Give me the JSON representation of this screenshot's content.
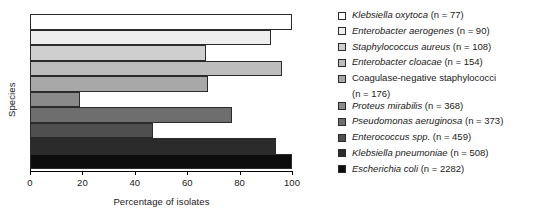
{
  "chart_data": {
    "type": "bar",
    "orientation": "horizontal",
    "title": "",
    "xlabel": "Percentage of isolates",
    "ylabel": "Species",
    "xlim": [
      0,
      100
    ],
    "grid": false,
    "legend_position": "right",
    "xticks": [
      "0",
      "20",
      "40",
      "60",
      "80",
      "100"
    ],
    "xtick_values": [
      0,
      20,
      40,
      60,
      80,
      100
    ],
    "categories": [
      "Klebsiella oxytoca",
      "Enterobacter aerogenes",
      "Staphylococcus aureus",
      "Enterobacter cloacae",
      "Coagulase-negative staphylococci",
      "Proteus mirabilis",
      "Pseudomonas aeruginosa",
      "Enterococcus spp.",
      "Klebsiella pneumoniae",
      "Escherichia coli"
    ],
    "values": [
      100,
      92,
      67,
      96,
      68,
      19,
      77,
      47,
      94,
      100
    ],
    "counts": [
      77,
      90,
      108,
      154,
      176,
      368,
      373,
      459,
      2282
    ],
    "colors": [
      "#ffffff",
      "#eeeeee",
      "#cfcfcf",
      "#bdbdbd",
      "#a8a8a8",
      "#8a8a8a",
      "#6e6e6e",
      "#4f4f4f",
      "#2b2b2b",
      "#0d0d0d"
    ]
  },
  "legend": {
    "items": [
      {
        "species": "Klebsiella oxytoca",
        "count": "(n = 77)",
        "italic": true,
        "color": "#ffffff",
        "wrap": false
      },
      {
        "species": "Enterobacter aerogenes",
        "count": "(n = 90)",
        "italic": true,
        "color": "#eeeeee",
        "wrap": false
      },
      {
        "species": "Staphylococcus aureus",
        "count": "(n = 108)",
        "italic": true,
        "color": "#cfcfcf",
        "wrap": false
      },
      {
        "species": "Enterobacter cloacae",
        "count": "(n = 154)",
        "italic": true,
        "color": "#bdbdbd",
        "wrap": false
      },
      {
        "species": "Coagulase-negative staphylococci",
        "count": "(n = 176)",
        "italic": false,
        "color": "#a8a8a8",
        "wrap": true
      },
      {
        "species": "Proteus mirabilis",
        "count": "(n = 368)",
        "italic": true,
        "color": "#8a8a8a",
        "wrap": false
      },
      {
        "species": "Pseudomonas aeruginosa",
        "count": "(n = 373)",
        "italic": true,
        "color": "#6e6e6e",
        "wrap": false
      },
      {
        "species": "Enterococcus spp.",
        "count": "(n = 459)",
        "italic": true,
        "color": "#4f4f4f",
        "wrap": false
      },
      {
        "species": "Klebsiella pneumoniae",
        "count": "(n = 508)",
        "italic": true,
        "color": "#2b2b2b",
        "wrap": false
      },
      {
        "species": "Escherichia coli",
        "count": "(n = 2282)",
        "italic": true,
        "color": "#0d0d0d",
        "wrap": false
      }
    ]
  }
}
